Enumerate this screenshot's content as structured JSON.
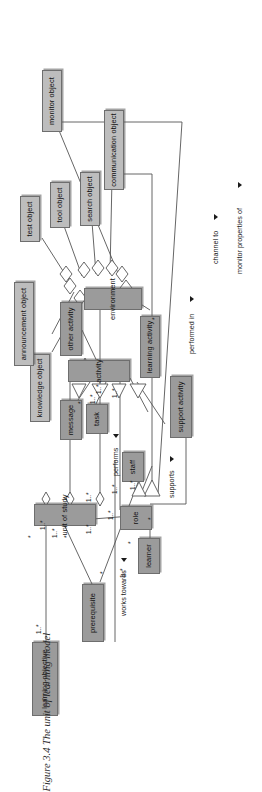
{
  "figure": {
    "caption_number": "Figure 3.4",
    "caption_text": "The unit of learning model",
    "caption_full": "Figure 3.4   The unit of learning model",
    "diagram_type": "uml-class-diagram",
    "orientation": "rotated-90-ccw",
    "colors": {
      "node_fill": "#a9a9a9",
      "node_fill_light": "#bdbdbd",
      "node_stroke": "#6e6e6e",
      "line": "#555555",
      "text": "#111111",
      "page_background": "#ffffff"
    }
  },
  "nodes": [
    {
      "id": "learning_objective",
      "label": "learning objective"
    },
    {
      "id": "prerequisite",
      "label": "prerequisite"
    },
    {
      "id": "learner",
      "label": "learner"
    },
    {
      "id": "role",
      "label": "role"
    },
    {
      "id": "staff",
      "label": "staff"
    },
    {
      "id": "support_activity",
      "label": "support activity"
    },
    {
      "id": "learning_activity",
      "label": "learning activity"
    },
    {
      "id": "other_activity",
      "label": "other activity"
    },
    {
      "id": "activity",
      "label": "activity"
    },
    {
      "id": "task",
      "label": "task"
    },
    {
      "id": "message",
      "label": "message"
    },
    {
      "id": "unit_of_study",
      "label": "unit of study"
    },
    {
      "id": "environment",
      "label": "environment"
    },
    {
      "id": "knowledge_object",
      "label": "knowledge object"
    },
    {
      "id": "announcement_object",
      "label": "announcement object"
    },
    {
      "id": "test_object",
      "label": "test object"
    },
    {
      "id": "tool_object",
      "label": "tool object"
    },
    {
      "id": "search_object",
      "label": "search object"
    },
    {
      "id": "communication_object",
      "label": "communication object"
    },
    {
      "id": "monitor_object",
      "label": "monitor object"
    }
  ],
  "association_labels": [
    {
      "id": "works_towards",
      "text": "works towards",
      "marker": "triangle"
    },
    {
      "id": "performs",
      "text": "performs",
      "marker": "triangle"
    },
    {
      "id": "supports",
      "text": "supports",
      "marker": "triangle"
    },
    {
      "id": "performed_in",
      "text": "performed in",
      "marker": "triangle"
    },
    {
      "id": "channel_to",
      "text": "channel to",
      "marker": "triangle"
    },
    {
      "id": "monitor_properties_of",
      "text": "monitor properties of",
      "marker": "triangle"
    }
  ],
  "multiplicities": [
    {
      "id": "m1",
      "text": "1..*"
    },
    {
      "id": "m2",
      "text": "1..*"
    },
    {
      "id": "m3",
      "text": "1..*"
    },
    {
      "id": "m4",
      "text": "1..*"
    },
    {
      "id": "m5",
      "text": "1..*"
    },
    {
      "id": "m6",
      "text": "1..*"
    },
    {
      "id": "m7",
      "text": "1..*"
    },
    {
      "id": "m8",
      "text": "1..*"
    },
    {
      "id": "m9",
      "text": "1..*"
    },
    {
      "id": "m10",
      "text": "1..*"
    },
    {
      "id": "m11",
      "text": "1..*"
    },
    {
      "id": "m12",
      "text": "1..*"
    },
    {
      "id": "s1",
      "text": "*"
    },
    {
      "id": "s2",
      "text": "*"
    },
    {
      "id": "s3",
      "text": "*"
    },
    {
      "id": "s4",
      "text": "*"
    },
    {
      "id": "s5",
      "text": "*"
    },
    {
      "id": "s6",
      "text": "*"
    },
    {
      "id": "s7",
      "text": "*"
    },
    {
      "id": "s8",
      "text": "*"
    }
  ]
}
